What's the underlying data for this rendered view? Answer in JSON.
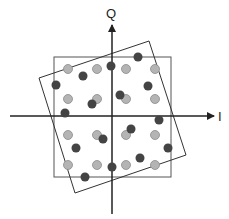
{
  "diagram": {
    "axes": {
      "i_label": "I",
      "q_label": "Q",
      "color": "#222222"
    },
    "colors": {
      "ideal_point": "#b4b4b4",
      "ideal_point_stroke": "#8a8a8a",
      "rotated_point": "#444444",
      "frame": "#555555"
    },
    "ideal_points": [
      [
        68,
        69
      ],
      [
        97,
        69
      ],
      [
        126,
        69
      ],
      [
        155,
        69
      ],
      [
        68,
        99
      ],
      [
        97,
        99
      ],
      [
        126,
        99
      ],
      [
        155,
        99
      ],
      [
        68,
        135
      ],
      [
        97,
        135
      ],
      [
        126,
        135
      ],
      [
        155,
        135
      ],
      [
        68,
        165
      ],
      [
        97,
        165
      ],
      [
        126,
        165
      ],
      [
        155,
        165
      ]
    ],
    "rotated_points": [
      [
        138,
        57
      ],
      [
        111,
        66
      ],
      [
        83,
        76
      ],
      [
        56,
        85
      ],
      [
        148,
        86
      ],
      [
        120,
        95
      ],
      [
        92,
        104
      ],
      [
        65,
        113
      ],
      [
        159,
        120
      ],
      [
        131,
        129
      ],
      [
        103,
        139
      ],
      [
        76,
        148
      ],
      [
        168,
        148
      ],
      [
        140,
        158
      ],
      [
        112,
        167
      ],
      [
        85,
        177
      ]
    ]
  }
}
